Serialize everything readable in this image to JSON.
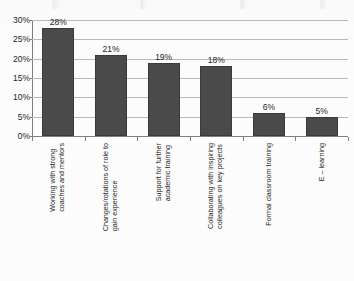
{
  "chart_data": {
    "type": "bar",
    "title": "",
    "subtitle": "",
    "xlabel": "",
    "ylabel": "",
    "ylim": [
      0,
      30
    ],
    "grid": true,
    "legend": "none",
    "orientation": "vertical",
    "value_label_suffix": "%",
    "categories": [
      "Working with strong coaches and mentors",
      "Changes/rotations of role to gain experience",
      "Support for further academic training",
      "Collaborating with inspiring colleagues on key projects",
      "Formal classroom training",
      "E – learning"
    ],
    "category_lines": [
      [
        "Working with strong",
        "coaches and mentors"
      ],
      [
        "Changes/rotations of role to",
        "gain experience"
      ],
      [
        "Support for further",
        "academic training"
      ],
      [
        "Collaborating with inspiring",
        "colleagues on key projects"
      ],
      [
        "Formal classroom training",
        ""
      ],
      [
        "E – learning",
        ""
      ]
    ],
    "values": [
      28,
      21,
      19,
      18,
      6,
      5
    ],
    "value_labels": [
      "28%",
      "21%",
      "19%",
      "18%",
      "6%",
      "5%"
    ],
    "y_ticks": [
      0,
      5,
      10,
      15,
      20,
      25,
      30
    ],
    "y_tick_labels": [
      "0%",
      "5%",
      "10%",
      "15%",
      "20%",
      "25%",
      "30%"
    ],
    "colors": {
      "bar_fill": "#4a4a4a",
      "bar_border": "#3a3a3a",
      "gridline": "#b9b9b9",
      "axis": "#7d7d7d",
      "text": "#1d1d1d",
      "background": "#fcfcfc"
    }
  }
}
